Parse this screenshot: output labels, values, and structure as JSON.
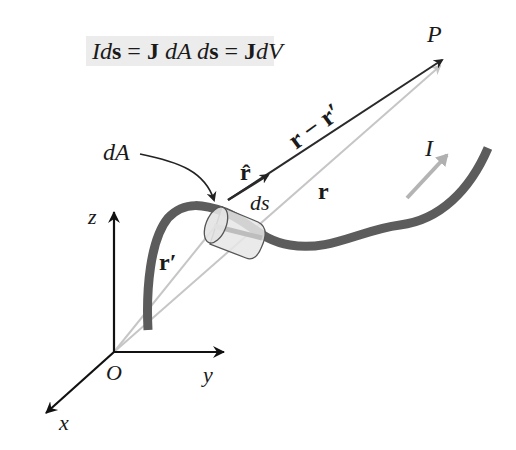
{
  "equation": {
    "parts": [
      {
        "text": "I",
        "style": "italic"
      },
      {
        "text": "d",
        "style": "italic"
      },
      {
        "text": "s",
        "style": "bold"
      },
      {
        "text": " = ",
        "style": "normal"
      },
      {
        "text": "J",
        "style": "bold"
      },
      {
        "text": " dA d",
        "style": "italic"
      },
      {
        "text": "s",
        "style": "bold"
      },
      {
        "text": " = ",
        "style": "normal"
      },
      {
        "text": "J",
        "style": "bold"
      },
      {
        "text": "dV",
        "style": "italic"
      }
    ],
    "full_text": "Ids = J dA ds = JdV"
  },
  "labels": {
    "point": "P",
    "r_minus_rprime": "r − r′",
    "r_hat": "r̂",
    "r": "r",
    "r_prime": "r′",
    "ds": "ds",
    "dA": "dA",
    "current": "I",
    "z_axis": "z",
    "y_axis": "y",
    "x_axis": "x",
    "origin": "O"
  },
  "colors": {
    "wire": "#5a5a5a",
    "dark_line": "#222222",
    "light_line": "#bdbdbd",
    "current_arrow": "#b0b0b0",
    "equation_bg": "#ececec"
  }
}
